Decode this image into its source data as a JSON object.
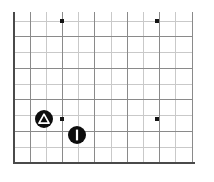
{
  "figure": {
    "title": "",
    "background_color": "#ffffff",
    "axis_color": "#4a4a4a",
    "grid_major_color": "#8a8a8a",
    "grid_minor_color": "#c9c9c9",
    "marker_color": "#141414"
  },
  "chart_data": {
    "type": "scatter",
    "title": "",
    "xlabel": "",
    "ylabel": "",
    "xlim": [
      0,
      11
    ],
    "ylim": [
      0,
      9
    ],
    "grid": true,
    "legend_position": "none",
    "xticklabels": [],
    "yticklabels": [],
    "grid_columns": 11,
    "grid_rows": 9,
    "series": [
      {
        "name": "points",
        "marker": "square",
        "points": [
          {
            "label": "p1",
            "x": 3,
            "y": 9,
            "px": 62,
            "py": 21
          },
          {
            "label": "p2",
            "x": 9,
            "y": 9,
            "px": 157,
            "py": 21
          },
          {
            "label": "p3",
            "x": 3,
            "y": 3,
            "px": 62,
            "py": 119
          },
          {
            "label": "p4",
            "x": 9,
            "y": 3,
            "px": 157,
            "py": 119
          }
        ]
      },
      {
        "name": "badges",
        "marker": "circle",
        "points": [
          {
            "label": "warning-badge",
            "icon": "triangle-icon",
            "x": 2,
            "y": 3,
            "px": 44,
            "py": 119,
            "radius": 9
          },
          {
            "label": "bar-badge",
            "icon": "vertical-bar-icon",
            "x": 4,
            "y": 2,
            "px": 77,
            "py": 135,
            "radius": 9
          }
        ]
      }
    ]
  },
  "axes": {
    "left_axis_x": 14,
    "bottom_axis_y": 163,
    "plot_right": 192,
    "plot_top": 21,
    "cell_size": 15.8
  }
}
